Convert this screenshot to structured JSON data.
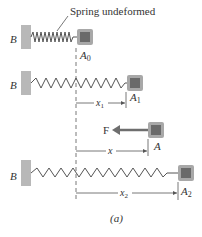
{
  "figure": {
    "caption": "(a)",
    "annotation": "Spring undeformed",
    "wall_label": "B",
    "colors": {
      "wall": "#b8b8b8",
      "block_outer": "#a8a8a8",
      "block_inner": "#6a6a6a",
      "spring": "#555555",
      "force_arrow": "#6e6e6e",
      "text": "#333333"
    },
    "rows": [
      {
        "id": "row0",
        "wall": "B",
        "block": "A",
        "block_sub": "0",
        "dimension": null
      },
      {
        "id": "row1",
        "wall": "B",
        "block": "A",
        "block_sub": "1",
        "dimension": {
          "label": "x",
          "sub": "1"
        }
      },
      {
        "id": "row-force",
        "wall": null,
        "block": "A",
        "block_sub": "",
        "force": "F",
        "dimension": {
          "label": "x",
          "sub": ""
        }
      },
      {
        "id": "row2",
        "wall": "B",
        "block": "A",
        "block_sub": "2",
        "dimension": {
          "label": "x",
          "sub": "2"
        }
      }
    ]
  }
}
